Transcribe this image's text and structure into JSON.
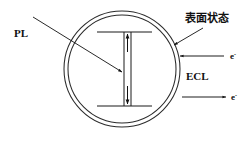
{
  "figure": {
    "type": "schematic-diagram",
    "background_color": "#ffffff",
    "line_color": "#111111",
    "canvas": {
      "width": 244,
      "height": 142
    }
  },
  "labels": {
    "pl": "PL",
    "ecl": "ECL",
    "surface_state": "表面状态",
    "electron_in": "e",
    "electron_in_charge": "-",
    "electron_out": "e",
    "electron_out_charge": "-"
  },
  "geometry": {
    "outer_circle": {
      "cx": 122,
      "cy": 69,
      "r": 58
    },
    "inner_circle": {
      "cx": 122,
      "cy": 69,
      "r": 54
    },
    "upper_level": {
      "x1": 97,
      "y1": 32,
      "x2": 152,
      "y2": 32
    },
    "lower_level": {
      "x1": 97,
      "y1": 106,
      "x2": 152,
      "y2": 106
    },
    "stem_left": {
      "x": 124,
      "y1": 32,
      "y2": 106
    },
    "stem_right": {
      "x": 131,
      "y1": 32,
      "y2": 106
    },
    "pl_pointer": {
      "x1": 33,
      "y1": 17,
      "x2": 124,
      "y2": 73
    },
    "surface_pointer": {
      "x1": 202,
      "y1": 27,
      "x2": 172,
      "y2": 44
    },
    "electron_in_arrow": {
      "x1": 224,
      "y1": 56,
      "x2": 181,
      "y2": 56,
      "direction": "left"
    },
    "electron_out_arrow": {
      "x1": 184,
      "y1": 97,
      "x2": 224,
      "y2": 97,
      "direction": "right"
    }
  },
  "annotations": {
    "pl_meaning": "photoluminescence excitation/emission within core",
    "ecl_meaning": "electrochemiluminescence at particle surface",
    "surface_state_meaning": "surface state layer of the shell"
  }
}
